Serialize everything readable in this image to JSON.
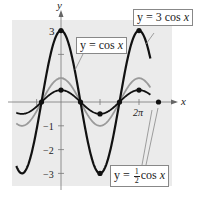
{
  "chart_data": {
    "type": "line",
    "title": "",
    "xlabel": "x",
    "ylabel": "y",
    "x_tick_labels": [
      "2π"
    ],
    "y_tick_labels": [
      "3",
      "-1",
      "-2",
      "-3"
    ],
    "ylim": [
      -3,
      3
    ],
    "xlim_radians": [
      -3.6,
      7.2
    ],
    "grid": false,
    "background": "#ebebeb",
    "series": [
      {
        "name": "y = 3 cos x",
        "amplitude": 3,
        "color": "#111111",
        "width": 2.2,
        "points": [
          [
            -3.1416,
            -3
          ],
          [
            -1.5708,
            0
          ],
          [
            0,
            3
          ],
          [
            1.5708,
            0
          ],
          [
            3.1416,
            -3
          ],
          [
            4.7124,
            0
          ],
          [
            6.2832,
            3
          ],
          [
            7.854,
            0
          ]
        ]
      },
      {
        "name": "y = cos x",
        "amplitude": 1,
        "color": "#9a9a9a",
        "width": 1.8,
        "points": [
          [
            -3.1416,
            -1
          ],
          [
            -1.5708,
            0
          ],
          [
            0,
            1
          ],
          [
            1.5708,
            0
          ],
          [
            3.1416,
            -1
          ],
          [
            4.7124,
            0
          ],
          [
            6.2832,
            1
          ],
          [
            7.854,
            0
          ]
        ]
      },
      {
        "name": "y = 1/2 cos x",
        "amplitude": 0.5,
        "color": "#111111",
        "width": 1.8,
        "points": [
          [
            -3.1416,
            -0.5
          ],
          [
            -1.5708,
            0
          ],
          [
            0,
            0.5
          ],
          [
            1.5708,
            0
          ],
          [
            3.1416,
            -0.5
          ],
          [
            4.7124,
            0
          ],
          [
            6.2832,
            0.5
          ],
          [
            7.854,
            0
          ]
        ]
      }
    ],
    "marked_points": [
      [
        0,
        3
      ],
      [
        0,
        0.5
      ],
      [
        1.5708,
        0
      ],
      [
        3.1416,
        -0.5
      ],
      [
        4.7124,
        0
      ],
      [
        6.2832,
        0.5
      ],
      [
        -1.5708,
        0
      ],
      [
        7.854,
        0
      ],
      [
        3.1416,
        -3
      ],
      [
        6.2832,
        3
      ]
    ],
    "annotations": [
      {
        "text": "y = 3 cos x",
        "target": "3cos"
      },
      {
        "text": "y = cos x",
        "target": "cos"
      },
      {
        "text": "y = ½ cos x",
        "target": "halfcos"
      }
    ]
  },
  "labels": {
    "x_axis": "x",
    "y_axis": "y",
    "tick_3": "3",
    "tick_m1": "−1",
    "tick_m2": "−2",
    "tick_m3": "−3",
    "tick_2pi": "2π",
    "callout_3cos_prefix": "y = 3 cos ",
    "callout_3cos_var": "x",
    "callout_cos_prefix": "y =  cos ",
    "callout_cos_var": "x",
    "callout_half_prefix": "y = ",
    "callout_half_num": "1",
    "callout_half_den": "2",
    "callout_half_suffix": "cos ",
    "callout_half_var": "x"
  }
}
